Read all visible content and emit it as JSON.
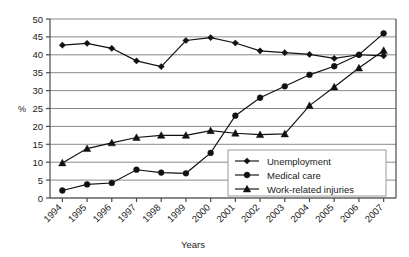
{
  "chart_data": {
    "type": "line",
    "title": "",
    "xlabel": "Years",
    "ylabel": "%",
    "categories": [
      "1994",
      "1995",
      "1996",
      "1997",
      "1998",
      "1999",
      "2000",
      "2001",
      "2002",
      "2003",
      "2004",
      "2005",
      "2006",
      "2007"
    ],
    "ylim": [
      0,
      50
    ],
    "yticks": [
      0,
      5,
      10,
      15,
      20,
      25,
      30,
      35,
      40,
      45,
      50
    ],
    "grid": "horizontal",
    "legend_position": "inside-lower-right",
    "series": [
      {
        "name": "Unemployment",
        "marker": "diamond",
        "values": [
          42.7,
          43.2,
          41.8,
          38.3,
          36.7,
          44.0,
          44.8,
          43.3,
          41.1,
          40.6,
          40.1,
          39.0,
          40.0,
          39.7
        ]
      },
      {
        "name": "Medical care",
        "marker": "circle",
        "values": [
          2.1,
          3.8,
          4.2,
          7.9,
          7.1,
          6.9,
          12.6,
          23.0,
          28.0,
          31.2,
          34.4,
          36.8,
          40.0,
          46.0
        ]
      },
      {
        "name": "Work-related injuries",
        "marker": "triangle",
        "values": [
          9.8,
          13.8,
          15.4,
          16.9,
          17.5,
          17.5,
          18.8,
          18.1,
          17.7,
          17.9,
          25.8,
          31.0,
          36.3,
          41.2
        ]
      }
    ],
    "colors": {
      "series": "#111111",
      "gridline": "#8a8a8a",
      "axis": "#4a4a4a",
      "background": "#ffffff"
    }
  },
  "legend": {
    "items": [
      {
        "label": "Unemployment"
      },
      {
        "label": "Medical care"
      },
      {
        "label": "Work-related injuries"
      }
    ]
  },
  "axes": {
    "y_title": "%",
    "x_title": "Years"
  }
}
